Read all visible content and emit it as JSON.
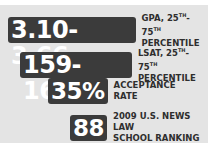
{
  "stats": [
    {
      "value": "3.10-3.66",
      "label_line1_prefix": "GPA, 25",
      "sup1": "TH",
      "dash": "-75",
      "sup2": "TH",
      "label_line2": "PERCENTILE"
    },
    {
      "value": "159-162",
      "label_line1_prefix": "LSAT, 25",
      "sup1": "TH",
      "dash": "-75",
      "sup2": "TH",
      "label_line2": "PERCENTILE"
    },
    {
      "value": "35%",
      "label_line1": "ACCEPTANCE",
      "label_line2": "RATE"
    },
    {
      "value": "88",
      "label_line1": "2009 U.S. NEWS LAW",
      "label_line2": "SCHOOL RANKING"
    }
  ],
  "colors": {
    "panel": "#e4e4e4",
    "badge": "#3b3b3b",
    "badge_text": "#ffffff",
    "label_text": "#2e2e2e"
  }
}
